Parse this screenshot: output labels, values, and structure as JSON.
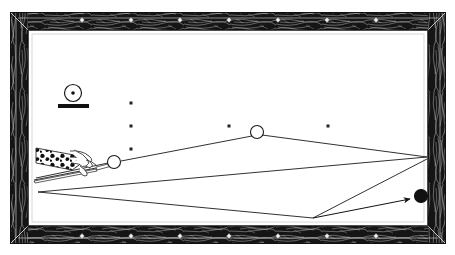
{
  "illustration": {
    "title": "Billiards bank shot diagram",
    "subject": "pool-table-top-view"
  },
  "table": {
    "frame_label": "wood-rail-frame",
    "frame_color": "#1a1a1a",
    "felt_color": "#ffffff",
    "line_color": "#1a1a1a",
    "outer": {
      "x": 10,
      "y": 12,
      "w": 436,
      "h": 232
    },
    "rail_thickness": 17,
    "playfield": {
      "x": 27,
      "y": 29,
      "w": 402,
      "h": 198
    },
    "rail_diamonds": {
      "label": "rail-sight-diamonds",
      "color": "#f2f2f2",
      "top_y": 20,
      "bottom_y": 236,
      "xs": [
        82,
        131,
        180,
        229,
        278,
        327,
        376
      ]
    }
  },
  "spots": {
    "label": "table-spots",
    "color": "#222222",
    "size": 3,
    "points": [
      {
        "x": 131,
        "y": 103
      },
      {
        "x": 131,
        "y": 126
      },
      {
        "x": 131,
        "y": 149
      },
      {
        "x": 229,
        "y": 126
      },
      {
        "x": 328,
        "y": 126
      }
    ]
  },
  "balls": [
    {
      "name": "cue-ball",
      "x": 114,
      "y": 162,
      "r": 6.5,
      "fill": "#ffffff",
      "stroke": "#1a1a1a"
    },
    {
      "name": "second-white-ball",
      "x": 257,
      "y": 132,
      "r": 6.5,
      "fill": "#ffffff",
      "stroke": "#1a1a1a"
    },
    {
      "name": "black-object-ball",
      "x": 421,
      "y": 196,
      "r": 6.5,
      "fill": "#111111",
      "stroke": "#111111"
    }
  ],
  "spin_indicator": {
    "label": "english-tip-position-indicator",
    "ball": {
      "x": 73,
      "y": 93,
      "r": 8.5
    },
    "center_dot_r": 1.8,
    "bar": {
      "x": 58,
      "y": 104,
      "w": 31,
      "h": 4
    },
    "stroke": "#1a1a1a",
    "fill": "#ffffff"
  },
  "shot_path": {
    "label": "ball-path-polyline",
    "stroke": "#1a1a1a",
    "width": 0.9,
    "segments": [
      {
        "name": "cue-to-second-ball",
        "from": [
          121,
          161
        ],
        "to": [
          252,
          136
        ]
      },
      {
        "name": "second-ball-to-right-rail",
        "from": [
          262,
          135
        ],
        "to": [
          427,
          157
        ]
      },
      {
        "name": "right-rail-to-left-rail",
        "from": [
          427,
          157
        ],
        "to": [
          38,
          192
        ]
      },
      {
        "name": "left-rail-to-bottom-vertex",
        "from": [
          38,
          192
        ],
        "to": [
          313,
          218
        ]
      },
      {
        "name": "bottom-vertex-to-right-rail-2",
        "from": [
          313,
          218
        ],
        "to": [
          427,
          159
        ]
      }
    ],
    "arrow": {
      "name": "shot-direction-arrow",
      "from": [
        313,
        218
      ],
      "to": [
        410,
        199
      ],
      "head_size": 8
    }
  },
  "cue": {
    "label": "cue-stick-and-hand",
    "stick": {
      "from": [
        36,
        178
      ],
      "to": [
        113,
        162
      ]
    },
    "shaft_lower": {
      "from": [
        34,
        180
      ],
      "to": [
        96,
        168
      ]
    },
    "sleeve": {
      "label": "patterned-sleeve",
      "points": "36,148 74,155 82,163 72,170 36,163",
      "pattern": "leopard-print"
    },
    "hand": {
      "label": "bridge-hand",
      "x": 74,
      "y": 152,
      "w": 28,
      "h": 22
    }
  }
}
